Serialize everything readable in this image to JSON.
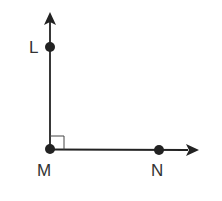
{
  "diagram": {
    "type": "geometry-right-angle",
    "colors": {
      "line": "#222222",
      "label": "#333333",
      "background": "#ffffff"
    },
    "points": [
      {
        "id": "L",
        "label": "L",
        "x": 50,
        "y": 47
      },
      {
        "id": "M",
        "label": "M",
        "x": 50,
        "y": 149
      },
      {
        "id": "N",
        "label": "N",
        "x": 159,
        "y": 150
      }
    ],
    "rays": [
      {
        "name": "ray-ML",
        "from": "M",
        "through": "L"
      },
      {
        "name": "ray-MN",
        "from": "M",
        "through": "N"
      }
    ],
    "angle_marker": {
      "vertex": "M",
      "type": "right-angle"
    }
  }
}
